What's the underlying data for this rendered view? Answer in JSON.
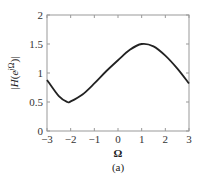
{
  "chart_data": {
    "type": "line",
    "title": "",
    "caption": "(a)",
    "xlabel": "Ω",
    "ylabel": "|H(e^{jΩ})|",
    "xlim": [
      -3,
      3
    ],
    "ylim": [
      0,
      2
    ],
    "grid": false,
    "xticks": [
      -3,
      -2,
      -1,
      0,
      1,
      2,
      3
    ],
    "xtick_labels": [
      "−3",
      "−2",
      "−1",
      "0",
      "1",
      "2",
      "3"
    ],
    "yticks": [
      0,
      0.5,
      1,
      1.5,
      2
    ],
    "ytick_labels": [
      "0",
      "0.5",
      "1",
      "1.5",
      "2"
    ],
    "series": [
      {
        "name": "|H(e^{jΩ})|",
        "color": "#222222",
        "x": [
          -3,
          -2.5,
          -2.14,
          -2,
          -1.5,
          -1,
          -0.5,
          0,
          0.5,
          1,
          1.5,
          2,
          2.5,
          3
        ],
        "y": [
          0.88,
          0.6,
          0.5,
          0.51,
          0.63,
          0.82,
          1.03,
          1.22,
          1.4,
          1.5,
          1.46,
          1.3,
          1.08,
          0.82
        ]
      }
    ]
  }
}
